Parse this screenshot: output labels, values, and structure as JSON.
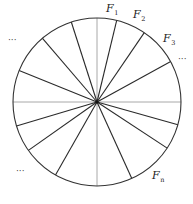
{
  "diagram": {
    "type": "circle-sectors",
    "center": [
      97,
      102
    ],
    "radius": 84,
    "colors": {
      "circle": "#333333",
      "radial": "#2a2a2a",
      "axis": "#a8a8a8"
    },
    "radial_endpoints": [
      [
        71,
        21
      ],
      [
        117,
        19
      ],
      [
        144,
        33
      ],
      [
        170,
        62
      ],
      [
        179,
        125
      ],
      [
        167,
        148
      ],
      [
        133,
        181
      ],
      [
        55,
        176
      ],
      [
        29,
        150
      ],
      [
        20,
        125
      ],
      [
        20,
        71
      ],
      [
        43,
        39
      ]
    ],
    "labels": [
      {
        "base": "F",
        "sub": "1",
        "x": 106,
        "y": 12
      },
      {
        "base": "F",
        "sub": "2",
        "x": 133,
        "y": 18
      },
      {
        "base": "F",
        "sub": "3",
        "x": 163,
        "y": 42
      },
      {
        "base": "F",
        "sub": "n",
        "x": 152,
        "y": 179
      }
    ],
    "ellipses": [
      {
        "text": "···",
        "x": 8,
        "y": 43
      },
      {
        "text": "···",
        "x": 178,
        "y": 62
      },
      {
        "text": "···",
        "x": 16,
        "y": 174
      }
    ]
  }
}
